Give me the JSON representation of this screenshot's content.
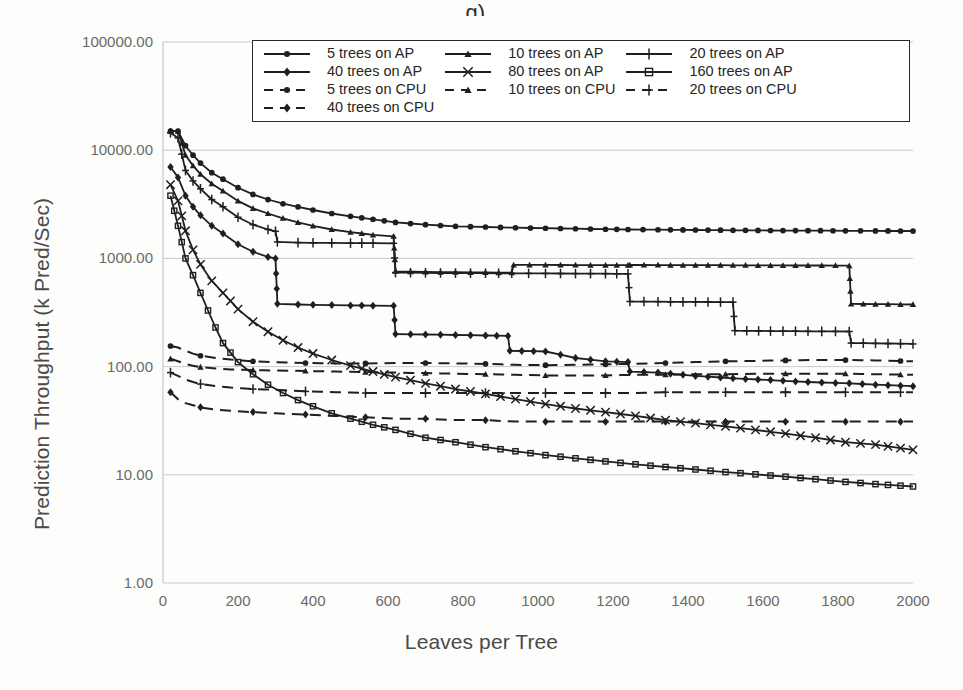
{
  "figure": {
    "title_partial": "g) ,",
    "background": "#fdfdfb",
    "plot_border_color": "#c9c9c9",
    "ink_color": "#1f1f1f"
  },
  "axes": {
    "ylabel": "Prediction Throughput (k Pred/Sec)",
    "xlabel": "Leaves per Tree",
    "yticks": [
      "100000.00",
      "10000.00",
      "1000.00",
      "100.00",
      "10.00",
      "1.00"
    ],
    "ytick_values": [
      100000,
      10000,
      1000,
      100,
      10,
      1
    ],
    "xticks": [
      "0",
      "200",
      "400",
      "600",
      "800",
      "1000",
      "1200",
      "1400",
      "1600",
      "1800",
      "2000"
    ],
    "xtick_values": [
      0,
      200,
      400,
      600,
      800,
      1000,
      1200,
      1400,
      1600,
      1800,
      2000
    ]
  },
  "legend": {
    "entries": [
      {
        "label": "5 trees on AP",
        "marker": "circle",
        "dash": "solid"
      },
      {
        "label": "10 trees on AP",
        "marker": "triangle",
        "dash": "solid"
      },
      {
        "label": "20 trees on AP",
        "marker": "plus",
        "dash": "solid"
      },
      {
        "label": "40 trees on AP",
        "marker": "diamond",
        "dash": "solid"
      },
      {
        "label": "80 trees on AP",
        "marker": "cross",
        "dash": "solid"
      },
      {
        "label": "160 trees on AP",
        "marker": "square",
        "dash": "solid"
      },
      {
        "label": "5 trees on CPU",
        "marker": "circle",
        "dash": "dashed"
      },
      {
        "label": "10 trees on CPU",
        "marker": "triangle",
        "dash": "dashed"
      },
      {
        "label": "20 trees on CPU",
        "marker": "plus",
        "dash": "dashed"
      },
      {
        "label": "40 trees on CPU",
        "marker": "diamond",
        "dash": "dashed"
      }
    ]
  },
  "chart_data": {
    "type": "line",
    "title": "",
    "xlabel": "Leaves per Tree",
    "ylabel": "Prediction Throughput (k Pred/Sec)",
    "yscale": "log",
    "ylim": [
      1,
      100000
    ],
    "xlim": [
      0,
      2000
    ],
    "grid": true,
    "legend_position": "top-center-inside",
    "series": [
      {
        "name": "5 trees on AP",
        "marker": "circle",
        "dash": "solid",
        "x": [
          20,
          40,
          60,
          80,
          100,
          130,
          160,
          200,
          240,
          280,
          320,
          360,
          400,
          450,
          500,
          560,
          620,
          700,
          780,
          860,
          940,
          1020,
          1100,
          1180,
          1240,
          1320,
          1420,
          1520,
          1620,
          1720,
          1820,
          1900,
          2000
        ],
        "y": [
          15000,
          15000,
          11000,
          9000,
          7600,
          6200,
          5400,
          4500,
          3900,
          3500,
          3200,
          3000,
          2800,
          2600,
          2450,
          2300,
          2150,
          2050,
          1980,
          1950,
          1920,
          1900,
          1880,
          1860,
          1850,
          1840,
          1830,
          1820,
          1810,
          1805,
          1800,
          1795,
          1790
        ]
      },
      {
        "name": "10 trees on AP",
        "marker": "triangle",
        "dash": "solid",
        "x": [
          20,
          40,
          60,
          80,
          100,
          130,
          160,
          200,
          240,
          280,
          320,
          360,
          400,
          450,
          500,
          560,
          615,
          620,
          700,
          780,
          860,
          930,
          935,
          1020,
          1100,
          1180,
          1240,
          1245,
          1320,
          1420,
          1520,
          1620,
          1720,
          1830,
          1835,
          1900,
          2000
        ],
        "y": [
          15000,
          15000,
          9000,
          7200,
          6000,
          4900,
          4200,
          3400,
          2900,
          2600,
          2350,
          2150,
          2000,
          1850,
          1750,
          1650,
          1600,
          760,
          750,
          745,
          740,
          738,
          870,
          870,
          868,
          866,
          865,
          870,
          868,
          866,
          864,
          862,
          860,
          858,
          380,
          378,
          375
        ]
      },
      {
        "name": "20 trees on AP",
        "marker": "plus",
        "dash": "solid",
        "x": [
          20,
          40,
          60,
          80,
          100,
          130,
          160,
          200,
          240,
          280,
          300,
          305,
          360,
          400,
          450,
          500,
          560,
          615,
          620,
          700,
          780,
          860,
          930,
          1020,
          1100,
          1180,
          1240,
          1245,
          1320,
          1420,
          1520,
          1525,
          1620,
          1720,
          1830,
          1835,
          1900,
          2000
        ],
        "y": [
          14500,
          13000,
          6500,
          5200,
          4400,
          3500,
          3000,
          2400,
          2050,
          1850,
          1780,
          1420,
          1400,
          1395,
          1390,
          1385,
          1382,
          1380,
          740,
          735,
          732,
          730,
          728,
          726,
          724,
          722,
          720,
          400,
          398,
          396,
          394,
          215,
          213,
          212,
          211,
          165,
          164,
          162
        ]
      },
      {
        "name": "40 trees on AP",
        "marker": "diamond",
        "dash": "solid",
        "x": [
          20,
          40,
          60,
          80,
          100,
          130,
          160,
          200,
          240,
          280,
          300,
          305,
          360,
          400,
          450,
          500,
          560,
          615,
          620,
          700,
          780,
          860,
          920,
          925,
          1020,
          1100,
          1180,
          1240,
          1245,
          1320,
          1420,
          1520,
          1620,
          1720,
          1830,
          1900,
          2000
        ],
        "y": [
          7000,
          5600,
          3800,
          3000,
          2500,
          2000,
          1700,
          1350,
          1150,
          1030,
          1000,
          380,
          375,
          372,
          370,
          368,
          366,
          365,
          200,
          198,
          196,
          194,
          192,
          140,
          138,
          120,
          112,
          110,
          90,
          88,
          82,
          78,
          75,
          72,
          70,
          68,
          66
        ]
      },
      {
        "name": "80 trees on AP",
        "marker": "cross",
        "dash": "solid",
        "x": [
          20,
          40,
          60,
          80,
          100,
          130,
          160,
          200,
          240,
          280,
          320,
          360,
          400,
          450,
          500,
          560,
          620,
          700,
          780,
          860,
          940,
          1020,
          1100,
          1180,
          1260,
          1340,
          1420,
          1500,
          1580,
          1660,
          1740,
          1820,
          1900,
          2000
        ],
        "y": [
          4800,
          3400,
          1800,
          1200,
          880,
          620,
          480,
          340,
          260,
          210,
          175,
          150,
          132,
          115,
          102,
          90,
          80,
          70,
          62,
          56,
          50,
          45,
          41,
          38,
          35,
          32,
          30,
          28,
          26,
          24,
          22,
          20,
          19,
          17
        ]
      },
      {
        "name": "160 trees on AP",
        "marker": "square",
        "dash": "solid",
        "x": [
          20,
          40,
          60,
          80,
          100,
          120,
          140,
          160,
          200,
          240,
          280,
          320,
          360,
          400,
          450,
          500,
          560,
          620,
          700,
          780,
          860,
          940,
          1020,
          1100,
          1180,
          1260,
          1340,
          1420,
          1500,
          1580,
          1660,
          1740,
          1820,
          1900,
          2000
        ],
        "y": [
          3800,
          2000,
          1000,
          700,
          480,
          330,
          230,
          165,
          110,
          85,
          68,
          57,
          49,
          43,
          37,
          33,
          29,
          26,
          22,
          20,
          18,
          16.5,
          15.2,
          14.2,
          13.3,
          12.5,
          11.8,
          11.2,
          10.6,
          10.1,
          9.6,
          9.1,
          8.6,
          8.2,
          7.8
        ]
      },
      {
        "name": "5 trees on CPU",
        "marker": "circle",
        "dash": "dashed",
        "x": [
          20,
          40,
          60,
          80,
          100,
          140,
          180,
          240,
          300,
          380,
          460,
          540,
          620,
          700,
          780,
          860,
          940,
          1020,
          1100,
          1180,
          1260,
          1340,
          1420,
          1500,
          1580,
          1660,
          1740,
          1820,
          1900,
          2000
        ],
        "y": [
          155,
          150,
          140,
          132,
          126,
          120,
          116,
          112,
          110,
          108,
          107,
          107,
          108,
          108,
          107,
          106,
          104,
          103,
          104,
          105,
          106,
          108,
          110,
          112,
          113,
          114,
          115,
          115,
          114,
          112
        ]
      },
      {
        "name": "10 trees on CPU",
        "marker": "triangle",
        "dash": "dashed",
        "x": [
          20,
          40,
          60,
          80,
          100,
          140,
          180,
          240,
          300,
          380,
          460,
          540,
          620,
          700,
          780,
          860,
          940,
          1020,
          1100,
          1180,
          1260,
          1340,
          1420,
          1500,
          1580,
          1660,
          1740,
          1820,
          1900,
          2000
        ],
        "y": [
          118,
          112,
          106,
          102,
          99,
          96,
          94,
          93,
          92,
          91,
          90,
          89,
          88,
          87,
          86,
          85,
          84,
          83,
          83,
          83,
          84,
          84,
          85,
          85,
          86,
          86,
          86,
          86,
          85,
          84
        ]
      },
      {
        "name": "20 trees on CPU",
        "marker": "plus",
        "dash": "dashed",
        "x": [
          20,
          40,
          60,
          80,
          100,
          140,
          180,
          240,
          300,
          380,
          460,
          540,
          620,
          700,
          780,
          860,
          940,
          1020,
          1100,
          1180,
          1260,
          1340,
          1420,
          1500,
          1580,
          1660,
          1740,
          1820,
          1900,
          2000
        ],
        "y": [
          88,
          82,
          76,
          72,
          69,
          66,
          64,
          62,
          61,
          59,
          58,
          57,
          57,
          57,
          57,
          57,
          57,
          57,
          57,
          57,
          57,
          58,
          58,
          58,
          58,
          58,
          58,
          58,
          58,
          58
        ]
      },
      {
        "name": "40 trees on CPU",
        "marker": "diamond",
        "dash": "dashed",
        "x": [
          20,
          40,
          60,
          80,
          100,
          140,
          180,
          240,
          300,
          380,
          460,
          540,
          620,
          700,
          780,
          860,
          940,
          1020,
          1100,
          1180,
          1260,
          1340,
          1420,
          1500,
          1580,
          1660,
          1740,
          1820,
          1900,
          2000
        ],
        "y": [
          58,
          50,
          46,
          44,
          42,
          40,
          39,
          38,
          37,
          36,
          35,
          34,
          33,
          33,
          32,
          32,
          31,
          31,
          31,
          31,
          31,
          31,
          31,
          31,
          31,
          31,
          31,
          31,
          31,
          31
        ]
      }
    ]
  }
}
